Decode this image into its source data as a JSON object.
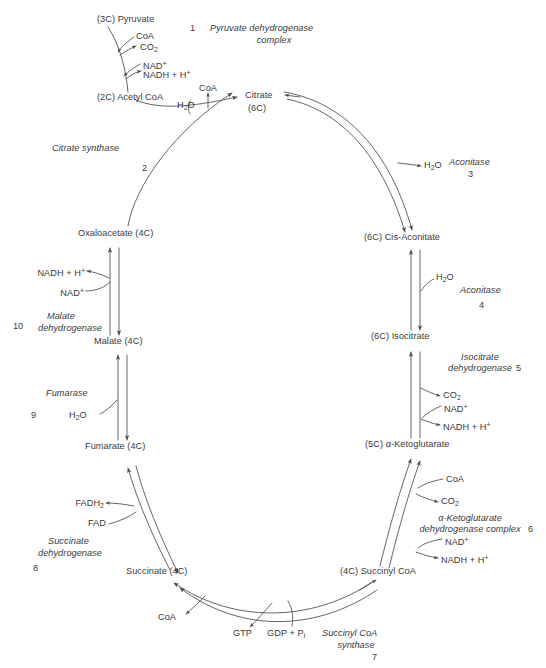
{
  "diagram": {
    "stroke_color": "#4a4a4a",
    "text_color": "#3a3a3a",
    "background": "#ffffff"
  },
  "metabolites": {
    "pyruvate": "(3C) Pyruvate",
    "acetyl_coa": "(2C) Acetyl CoA",
    "citrate_name": "Citrate",
    "citrate_carbons": "(6C)",
    "cis_aconitate": "(6C) Cis-Aconitate",
    "isocitrate": "(6C) Isocitrate",
    "ketoglutarate": "(5C) α-Ketoglutarate",
    "succinyl_coa": "(4C) Succinyl CoA",
    "succinate": "Succinate (4C)",
    "fumarate": "Fumarate (4C)",
    "malate": "Malate (4C)",
    "oxaloacetate": "Oxaloacetate (4C)"
  },
  "cofactors": {
    "coa_pyruvate": "CoA",
    "co2_pyruvate": "CO",
    "co2_pyruvate_sub": "2",
    "nad_pyruvate": "NAD",
    "nad_pyruvate_sup": "+",
    "nadh_pyruvate": "NADH + H",
    "nadh_pyruvate_sup": "+",
    "h2o_citrate": "H",
    "h2o_citrate_sub": "2",
    "h2o_citrate_tail": "O",
    "coa_citrate": "CoA",
    "h2o_aconitase3": "H",
    "h2o_aconitase3_sub": "2",
    "h2o_aconitase3_tail": "O",
    "h2o_aconitase4": "H",
    "h2o_aconitase4_sub": "2",
    "h2o_aconitase4_tail": "O",
    "co2_isocitrate": "CO",
    "co2_isocitrate_sub": "2",
    "nad_isocitrate": "NAD",
    "nad_isocitrate_sup": "+",
    "nadh_isocitrate": "NADH + H",
    "nadh_isocitrate_sup": "+",
    "coa_kg": "CoA",
    "co2_kg": "CO",
    "co2_kg_sub": "2",
    "nad_kg": "NAD",
    "nad_kg_sup": "+",
    "nadh_kg": "NADH + H",
    "nadh_kg_sup": "+",
    "gtp": "GTP",
    "gdp_pi": "GDP + P",
    "gdp_pi_sub": "i",
    "coa_succinate": "CoA",
    "fadh2": "FADH",
    "fadh2_sub": "2",
    "fad": "FAD",
    "h2o_fumarase": "H",
    "h2o_fumarase_sub": "2",
    "h2o_fumarase_tail": "O",
    "nadh_malate": "NADH + H",
    "nadh_malate_sup": "+",
    "nad_malate": "NAD",
    "nad_malate_sup": "+"
  },
  "enzymes": [
    {
      "step": "1",
      "name_line1": "Pyruvate dehydrogenase",
      "name_line2": "complex"
    },
    {
      "step": "2",
      "name_line1": "Citrate synthase",
      "name_line2": ""
    },
    {
      "step": "3",
      "name_line1": "Aconitase",
      "name_line2": ""
    },
    {
      "step": "4",
      "name_line1": "Aconitase",
      "name_line2": ""
    },
    {
      "step": "5",
      "name_line1": "Isocitrate",
      "name_line2": "dehydrogenase"
    },
    {
      "step": "6",
      "name_line1": "α-Ketoglutarate",
      "name_line2": "dehydrogenase complex"
    },
    {
      "step": "7",
      "name_line1": "Succinyl CoA",
      "name_line2": "synthase"
    },
    {
      "step": "8",
      "name_line1": "Succinate",
      "name_line2": "dehydrogenase"
    },
    {
      "step": "9",
      "name_line1": "Fumarase",
      "name_line2": ""
    },
    {
      "step": "10",
      "name_line1": "Malate",
      "name_line2": "dehydrogenase"
    }
  ]
}
